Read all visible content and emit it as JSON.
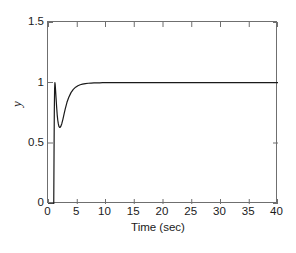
{
  "chart_data": {
    "type": "line",
    "title": "",
    "xlabel": "Time (sec)",
    "ylabel": "y",
    "xlim": [
      0,
      40
    ],
    "ylim": [
      0,
      1.5
    ],
    "xticks": [
      0,
      5,
      10,
      15,
      20,
      25,
      30,
      35,
      40
    ],
    "xtick_labels": [
      "0",
      "5",
      "10",
      "15",
      "20",
      "25",
      "30",
      "35",
      "40"
    ],
    "yticks": [
      0,
      0.5,
      1,
      1.5
    ],
    "ytick_labels": [
      "0",
      "0.5",
      "1",
      "1.5"
    ],
    "grid": false,
    "legend": null,
    "line_color": "#1a1a1a",
    "line_width": 1.2,
    "series": [
      {
        "name": "y",
        "x": [
          0,
          0.2,
          0.4,
          0.6,
          0.8,
          0.95,
          1.0,
          1.05,
          1.1,
          1.15,
          1.2,
          1.25,
          1.3,
          1.4,
          1.5,
          1.6,
          1.7,
          1.8,
          1.9,
          2.0,
          2.1,
          2.2,
          2.4,
          2.6,
          2.8,
          3.0,
          3.3,
          3.6,
          4.0,
          4.4,
          4.8,
          5.2,
          5.6,
          6.0,
          6.5,
          7.0,
          7.5,
          8.0,
          8.5,
          9.0,
          9.5,
          10.0,
          12.0,
          15.0,
          20.0,
          25.0,
          30.0,
          35.0,
          40.0
        ],
        "y": [
          0,
          0,
          0,
          0,
          0,
          0,
          0,
          0.42,
          0.78,
          0.95,
          1.0,
          0.985,
          0.95,
          0.875,
          0.8,
          0.735,
          0.69,
          0.66,
          0.64,
          0.632,
          0.631,
          0.637,
          0.662,
          0.7,
          0.742,
          0.784,
          0.838,
          0.878,
          0.918,
          0.945,
          0.963,
          0.975,
          0.983,
          0.988,
          0.992,
          0.995,
          0.997,
          0.998,
          0.999,
          0.999,
          1.0,
          1.0,
          1.0,
          1.0,
          1.0,
          1.0,
          1.0,
          1.0,
          1.0
        ]
      }
    ],
    "annotations": {
      "peak_value": 1.0,
      "peak_time": 1.2,
      "undershoot_value": 0.63,
      "undershoot_time": 2.0,
      "steady_state": 1.0,
      "step_onset_time": 1.0
    }
  },
  "caption": {
    "partial_text": ""
  }
}
